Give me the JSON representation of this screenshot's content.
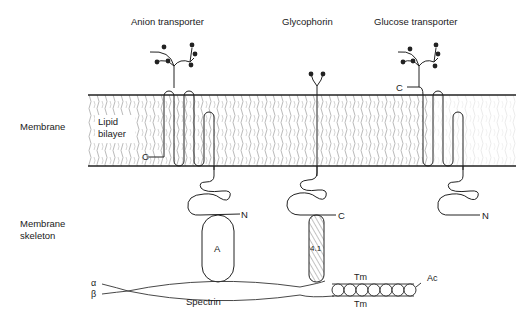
{
  "titles": {
    "anion_transporter": "Anion transporter",
    "glycophorin": "Glycophorin",
    "glucose_transporter": "Glucose transporter"
  },
  "side_labels": {
    "membrane": "Membrane",
    "membrane_skeleton_line1": "Membrane",
    "membrane_skeleton_line2": "skeleton"
  },
  "membrane": {
    "lipid_line1": "Lipid",
    "lipid_line2": "bilayer"
  },
  "termini": {
    "anion_c": "C",
    "anion_n": "N",
    "glycophorin_c": "C",
    "glucose_c": "C",
    "glucose_n": "N"
  },
  "skeleton": {
    "ankyrin": "A",
    "band41": "4.1",
    "alpha": "α",
    "beta": "β",
    "spectrin": "Spectrin",
    "tm_top": "Tm",
    "tm_bottom": "Tm",
    "actin": "Ac"
  }
}
